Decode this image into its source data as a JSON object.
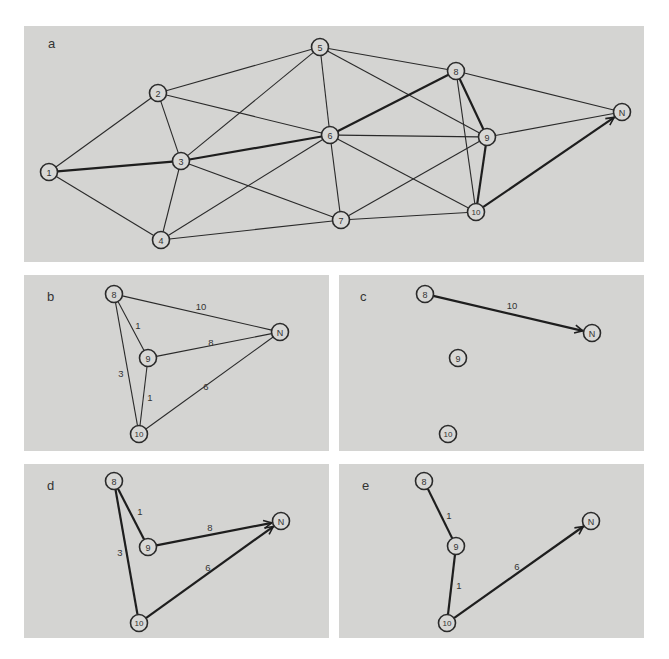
{
  "header": {
    "text": ""
  },
  "panels": [
    {
      "id": "a",
      "letter": "a",
      "rect": [
        24,
        26,
        620,
        236
      ],
      "letter_pos": [
        48,
        48
      ],
      "nodes": [
        {
          "id": "1",
          "label": "1",
          "x": 49,
          "y": 172
        },
        {
          "id": "2",
          "label": "2",
          "x": 158,
          "y": 93
        },
        {
          "id": "3",
          "label": "3",
          "x": 181,
          "y": 161
        },
        {
          "id": "4",
          "label": "4",
          "x": 161,
          "y": 240
        },
        {
          "id": "5",
          "label": "5",
          "x": 320,
          "y": 47
        },
        {
          "id": "6",
          "label": "6",
          "x": 330,
          "y": 135
        },
        {
          "id": "7",
          "label": "7",
          "x": 341,
          "y": 220
        },
        {
          "id": "8",
          "label": "8",
          "x": 456,
          "y": 71
        },
        {
          "id": "9",
          "label": "9",
          "x": 487,
          "y": 137
        },
        {
          "id": "10",
          "label": "10",
          "x": 476,
          "y": 212
        },
        {
          "id": "N",
          "label": "N",
          "x": 622,
          "y": 112
        }
      ],
      "edges": [
        {
          "from": "1",
          "to": "2"
        },
        {
          "from": "1",
          "to": "3",
          "bold": true
        },
        {
          "from": "1",
          "to": "4"
        },
        {
          "from": "2",
          "to": "3"
        },
        {
          "from": "2",
          "to": "5"
        },
        {
          "from": "2",
          "to": "6"
        },
        {
          "from": "3",
          "to": "4"
        },
        {
          "from": "3",
          "to": "5"
        },
        {
          "from": "3",
          "to": "6",
          "bold": true
        },
        {
          "from": "3",
          "to": "7"
        },
        {
          "from": "4",
          "to": "6"
        },
        {
          "from": "4",
          "to": "7"
        },
        {
          "from": "5",
          "to": "6"
        },
        {
          "from": "5",
          "to": "8"
        },
        {
          "from": "5",
          "to": "9"
        },
        {
          "from": "6",
          "to": "7"
        },
        {
          "from": "6",
          "to": "8",
          "bold": true
        },
        {
          "from": "6",
          "to": "9"
        },
        {
          "from": "6",
          "to": "10"
        },
        {
          "from": "7",
          "to": "9"
        },
        {
          "from": "7",
          "to": "10"
        },
        {
          "from": "8",
          "to": "9",
          "bold": true
        },
        {
          "from": "8",
          "to": "10"
        },
        {
          "from": "8",
          "to": "N"
        },
        {
          "from": "9",
          "to": "10",
          "bold": true
        },
        {
          "from": "9",
          "to": "N"
        },
        {
          "from": "10",
          "to": "N",
          "bold": true,
          "arrow": true
        }
      ],
      "weights": []
    },
    {
      "id": "b",
      "letter": "b",
      "rect": [
        24,
        275,
        305,
        176
      ],
      "letter_pos": [
        47,
        301
      ],
      "nodes": [
        {
          "id": "8",
          "label": "8",
          "x": 114,
          "y": 294
        },
        {
          "id": "9",
          "label": "9",
          "x": 148,
          "y": 358
        },
        {
          "id": "10",
          "label": "10",
          "x": 139,
          "y": 434
        },
        {
          "id": "N",
          "label": "N",
          "x": 280,
          "y": 332
        }
      ],
      "edges": [
        {
          "from": "8",
          "to": "N"
        },
        {
          "from": "8",
          "to": "9"
        },
        {
          "from": "8",
          "to": "10"
        },
        {
          "from": "9",
          "to": "N"
        },
        {
          "from": "9",
          "to": "10"
        },
        {
          "from": "10",
          "to": "N"
        }
      ],
      "weights": [
        {
          "text": "10",
          "x": 201,
          "y": 306
        },
        {
          "text": "1",
          "x": 138,
          "y": 325
        },
        {
          "text": "8",
          "x": 211,
          "y": 342
        },
        {
          "text": "3",
          "x": 121,
          "y": 373
        },
        {
          "text": "1",
          "x": 150,
          "y": 397
        },
        {
          "text": "6",
          "x": 206,
          "y": 386
        }
      ]
    },
    {
      "id": "c",
      "letter": "c",
      "rect": [
        339,
        275,
        305,
        176
      ],
      "letter_pos": [
        360,
        301
      ],
      "nodes": [
        {
          "id": "8",
          "label": "8",
          "x": 425,
          "y": 294
        },
        {
          "id": "9",
          "label": "9",
          "x": 458,
          "y": 358
        },
        {
          "id": "10",
          "label": "10",
          "x": 448,
          "y": 434
        },
        {
          "id": "N",
          "label": "N",
          "x": 592,
          "y": 333
        }
      ],
      "edges": [
        {
          "from": "8",
          "to": "N",
          "bold": true,
          "arrow": true
        }
      ],
      "weights": [
        {
          "text": "10",
          "x": 512,
          "y": 305
        }
      ]
    },
    {
      "id": "d",
      "letter": "d",
      "rect": [
        24,
        464,
        305,
        174
      ],
      "letter_pos": [
        47,
        490
      ],
      "nodes": [
        {
          "id": "8",
          "label": "8",
          "x": 114,
          "y": 481
        },
        {
          "id": "9",
          "label": "9",
          "x": 148,
          "y": 547
        },
        {
          "id": "10",
          "label": "10",
          "x": 139,
          "y": 623
        },
        {
          "id": "N",
          "label": "N",
          "x": 281,
          "y": 521
        }
      ],
      "edges": [
        {
          "from": "8",
          "to": "9",
          "bold": true
        },
        {
          "from": "8",
          "to": "10",
          "bold": true
        },
        {
          "from": "9",
          "to": "N",
          "bold": true,
          "arrow": true
        },
        {
          "from": "10",
          "to": "N",
          "bold": true,
          "arrow": true
        }
      ],
      "weights": [
        {
          "text": "1",
          "x": 140,
          "y": 511
        },
        {
          "text": "8",
          "x": 210,
          "y": 527
        },
        {
          "text": "3",
          "x": 120,
          "y": 552
        },
        {
          "text": "6",
          "x": 208,
          "y": 567
        }
      ]
    },
    {
      "id": "e",
      "letter": "e",
      "rect": [
        339,
        464,
        305,
        174
      ],
      "letter_pos": [
        362,
        490
      ],
      "nodes": [
        {
          "id": "8",
          "label": "8",
          "x": 424,
          "y": 481
        },
        {
          "id": "9",
          "label": "9",
          "x": 456,
          "y": 546
        },
        {
          "id": "10",
          "label": "10",
          "x": 447,
          "y": 623
        },
        {
          "id": "N",
          "label": "N",
          "x": 591,
          "y": 521
        }
      ],
      "edges": [
        {
          "from": "8",
          "to": "9",
          "bold": true
        },
        {
          "from": "9",
          "to": "10",
          "bold": true
        },
        {
          "from": "10",
          "to": "N",
          "bold": true,
          "arrow": true
        }
      ],
      "weights": [
        {
          "text": "1",
          "x": 449,
          "y": 515
        },
        {
          "text": "1",
          "x": 459,
          "y": 585
        },
        {
          "text": "6",
          "x": 517,
          "y": 566
        }
      ]
    }
  ]
}
